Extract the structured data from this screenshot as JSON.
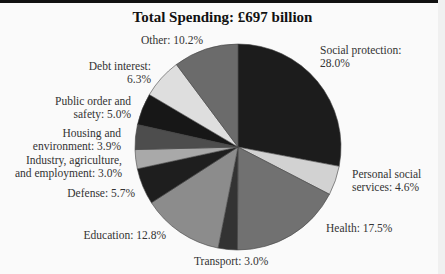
{
  "chart_data": {
    "type": "pie",
    "title": "Total Spending: £697 billion",
    "start_angle": "12 o'clock",
    "direction": "clockwise",
    "unit": "%",
    "slices": [
      {
        "label": "Social protection",
        "value": 28.0,
        "color": "#1c1c1c"
      },
      {
        "label": "Personal social services",
        "value": 4.6,
        "color": "#d2d2d2"
      },
      {
        "label": "Health",
        "value": 17.5,
        "color": "#717171"
      },
      {
        "label": "Transport",
        "value": 3.0,
        "color": "#333333"
      },
      {
        "label": "Education",
        "value": 12.8,
        "color": "#8c8c8c"
      },
      {
        "label": "Defense",
        "value": 5.7,
        "color": "#1e1e1e"
      },
      {
        "label": "Industry, agriculture, and employment",
        "value": 3.0,
        "color": "#a9a9a9"
      },
      {
        "label": "Housing and environment",
        "value": 3.9,
        "color": "#4d4d4d"
      },
      {
        "label": "Public order and safety",
        "value": 5.0,
        "color": "#171717"
      },
      {
        "label": "Debt interest",
        "value": 6.3,
        "color": "#dedede"
      },
      {
        "label": "Other",
        "value": 10.2,
        "color": "#6b6b6b"
      }
    ]
  },
  "labels": {
    "social_protection": "Social protection:\n28.0%",
    "personal_social": "Personal social\nservices: 4.6%",
    "health": "Health: 17.5%",
    "transport": "Transport: 3.0%",
    "education": "Education: 12.8%",
    "defense": "Defense: 5.7%",
    "industry": "Industry, agriculture,\nand employment: 3.0%",
    "housing": "Housing and\nenvironment: 3.9%",
    "public_order": "Public order and\nsafety: 5.0%",
    "debt": "Debt interest:\n6.3%",
    "other": "Other: 10.2%"
  }
}
